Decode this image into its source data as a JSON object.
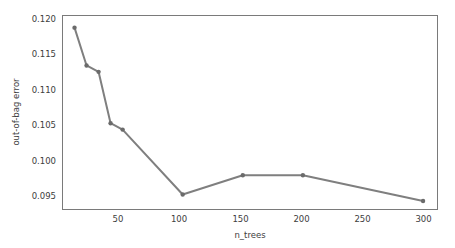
{
  "chart_data": {
    "type": "line",
    "title": "",
    "xlabel": "n_trees",
    "ylabel": "out-of-bag error",
    "x": [
      10,
      20,
      30,
      40,
      50,
      100,
      150,
      200,
      300
    ],
    "values": [
      0.119,
      0.1137,
      0.1128,
      0.1056,
      0.1047,
      0.0956,
      0.0983,
      0.0983,
      0.0947
    ],
    "series": [
      {
        "name": "out-of-bag error",
        "values": [
          0.119,
          0.1137,
          0.1128,
          0.1056,
          0.1047,
          0.0956,
          0.0983,
          0.0983,
          0.0947
        ]
      }
    ],
    "xlim": [
      0,
      312
    ],
    "ylim": [
      0.0935,
      0.1207
    ],
    "xticks": [
      50,
      100,
      150,
      200,
      250,
      300
    ],
    "yticks": [
      0.095,
      0.1,
      0.105,
      0.11,
      0.115,
      0.12
    ],
    "xtick_labels": [
      "50",
      "100",
      "150",
      "200",
      "250",
      "300"
    ],
    "ytick_labels": [
      "0.095",
      "0.100",
      "0.105",
      "0.110",
      "0.115",
      "0.120"
    ],
    "grid": false,
    "legend": "none",
    "marker": "circle",
    "line_color": "#7f7f7f",
    "marker_color": "#6b6b6b",
    "frame_color": "#7a7a7a",
    "text_color": "#3d3d3d"
  },
  "axes": {
    "x_title": "n_trees",
    "y_title": "out-of-bag error",
    "x_tick_labels": [
      "50",
      "100",
      "150",
      "200",
      "250",
      "300"
    ],
    "y_tick_labels": [
      "0.095",
      "0.100",
      "0.105",
      "0.110",
      "0.115",
      "0.120"
    ]
  }
}
